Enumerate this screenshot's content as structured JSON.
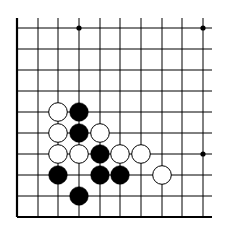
{
  "board": {
    "title": "Go board fragment (bottom-left corner)",
    "columns": 10,
    "rows": 10,
    "x_lines": [
      17,
      38,
      58,
      79,
      100,
      120,
      141,
      162,
      182,
      203
    ],
    "y_lines": [
      28,
      49,
      70,
      91,
      112,
      133,
      154,
      175,
      196,
      217
    ],
    "line_color": "#000000",
    "background": "#ffffff",
    "edges": {
      "left": true,
      "bottom": true,
      "top": false,
      "right": false
    },
    "star_points": [
      {
        "col": 3,
        "row": 0
      },
      {
        "col": 9,
        "row": 0
      },
      {
        "col": 9,
        "row": 6
      }
    ],
    "stones": [
      {
        "color": "white",
        "col": 2,
        "row": 4
      },
      {
        "color": "black",
        "col": 3,
        "row": 4
      },
      {
        "color": "white",
        "col": 2,
        "row": 5
      },
      {
        "color": "black",
        "col": 3,
        "row": 5
      },
      {
        "color": "white",
        "col": 4,
        "row": 5
      },
      {
        "color": "white",
        "col": 2,
        "row": 6
      },
      {
        "color": "white",
        "col": 3,
        "row": 6
      },
      {
        "color": "black",
        "col": 4,
        "row": 6
      },
      {
        "color": "white",
        "col": 5,
        "row": 6
      },
      {
        "color": "white",
        "col": 6,
        "row": 6
      },
      {
        "color": "black",
        "col": 2,
        "row": 7
      },
      {
        "color": "black",
        "col": 4,
        "row": 7
      },
      {
        "color": "black",
        "col": 5,
        "row": 7
      },
      {
        "color": "white",
        "col": 7,
        "row": 7
      },
      {
        "color": "black",
        "col": 3,
        "row": 8
      }
    ]
  }
}
